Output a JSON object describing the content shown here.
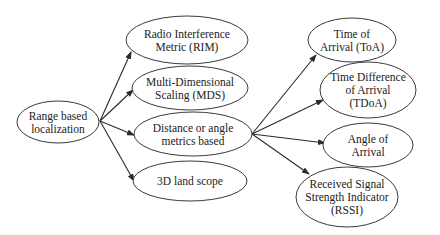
{
  "diagram": {
    "type": "tree",
    "colors": {
      "stroke": "#3a3a3a",
      "text": "#222222",
      "background": "#ffffff"
    },
    "nodes": [
      {
        "id": "root",
        "lines": [
          "Range based",
          "localization"
        ],
        "cx": 58,
        "cy": 122,
        "rx": 41,
        "ry": 21
      },
      {
        "id": "rim",
        "lines": [
          "Radio Interference",
          "Metric (RIM)"
        ],
        "cx": 187,
        "cy": 40,
        "rx": 61,
        "ry": 24
      },
      {
        "id": "mds",
        "lines": [
          "Multi-Dimensional",
          "Scaling (MDS)"
        ],
        "cx": 190,
        "cy": 88,
        "rx": 58,
        "ry": 22
      },
      {
        "id": "dist",
        "lines": [
          "Distance or angle",
          "metrics based"
        ],
        "cx": 193,
        "cy": 134,
        "rx": 59,
        "ry": 22
      },
      {
        "id": "land",
        "lines": [
          "3D land scope"
        ],
        "cx": 190,
        "cy": 181,
        "rx": 57,
        "ry": 20
      },
      {
        "id": "toa",
        "lines": [
          "Time of",
          "Arrival (ToA)"
        ],
        "cx": 352,
        "cy": 40,
        "rx": 44,
        "ry": 22
      },
      {
        "id": "tdoa",
        "lines": [
          "Time Difference",
          "of Arrival",
          "(TDoA)"
        ],
        "cx": 368,
        "cy": 90,
        "rx": 48,
        "ry": 28
      },
      {
        "id": "aoa",
        "lines": [
          "Angle of",
          "Arrival"
        ],
        "cx": 368,
        "cy": 145,
        "rx": 45,
        "ry": 22
      },
      {
        "id": "rssi",
        "lines": [
          "Received Signal",
          "Strength Indicator",
          "(RSSI)"
        ],
        "cx": 347,
        "cy": 197,
        "rx": 51,
        "ry": 30
      }
    ],
    "edges": [
      {
        "from": "root",
        "to": "rim",
        "x1": 100,
        "y1": 121,
        "x2": 131,
        "y2": 52
      },
      {
        "from": "root",
        "to": "mds",
        "x1": 100,
        "y1": 121,
        "x2": 133,
        "y2": 90
      },
      {
        "from": "root",
        "to": "dist",
        "x1": 100,
        "y1": 121,
        "x2": 134,
        "y2": 135
      },
      {
        "from": "root",
        "to": "land",
        "x1": 100,
        "y1": 121,
        "x2": 134,
        "y2": 181
      },
      {
        "from": "dist",
        "to": "toa",
        "x1": 252,
        "y1": 134,
        "x2": 316,
        "y2": 55
      },
      {
        "from": "dist",
        "to": "tdoa",
        "x1": 252,
        "y1": 134,
        "x2": 323,
        "y2": 100
      },
      {
        "from": "dist",
        "to": "aoa",
        "x1": 252,
        "y1": 134,
        "x2": 325,
        "y2": 143
      },
      {
        "from": "dist",
        "to": "rssi",
        "x1": 252,
        "y1": 134,
        "x2": 309,
        "y2": 174
      }
    ]
  }
}
